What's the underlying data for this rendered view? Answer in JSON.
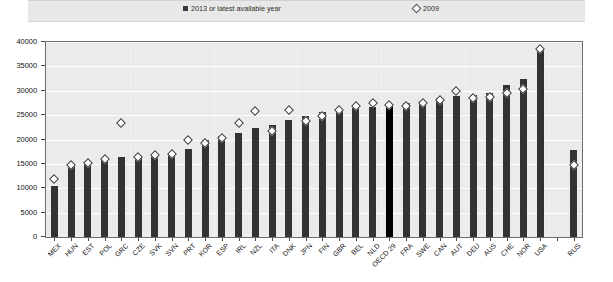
{
  "legend": {
    "items": [
      {
        "label": "2013 or latest available year",
        "marker": "filled-square-icon",
        "color": "#3a3a3a"
      },
      {
        "label": "2009",
        "marker": "open-diamond-icon",
        "color": "#ffffff"
      }
    ]
  },
  "axis": {
    "y_ticks": [
      "0",
      "5000",
      "10000",
      "15000",
      "20000",
      "25000",
      "30000",
      "35000",
      "40000"
    ]
  },
  "colors": {
    "bar": "#333333",
    "bar_highlight": "#000000",
    "marker_fill": "#ffffff",
    "marker_edge": "#3d3d3d",
    "plot_background": "#ebebeb",
    "legend_background": "#e8e8e8",
    "gridline": "#ffffff"
  },
  "chart_data": {
    "type": "bar",
    "title": "",
    "xlabel": "",
    "ylabel": "",
    "ylim": [
      0,
      40000
    ],
    "ytick_step": 5000,
    "grid": true,
    "legend_position": "top",
    "highlight_category": "OECD 29",
    "categories": [
      "MEX",
      "HUN",
      "EST",
      "POL",
      "GRC",
      "CZE",
      "SVK",
      "SVN",
      "PRT",
      "KOR",
      "ESP",
      "IRL",
      "NZL",
      "ITA",
      "DNK",
      "JPN",
      "FIN",
      "GBR",
      "BEL",
      "NLD",
      "OECD 29",
      "FRA",
      "SWE",
      "CAN",
      "AUT",
      "DEU",
      "AUS",
      "CHE",
      "NOR",
      "USA",
      "",
      "RUS"
    ],
    "series": [
      {
        "name": "2013 or latest available year",
        "type": "bar",
        "values": [
          10400,
          14600,
          15500,
          16200,
          16400,
          16600,
          16900,
          17200,
          18100,
          19900,
          20700,
          21400,
          22400,
          22900,
          24000,
          24800,
          25600,
          26100,
          26400,
          26700,
          26900,
          27500,
          28000,
          28600,
          29000,
          29100,
          29500,
          31100,
          32400,
          38700,
          null,
          17800
        ]
      },
      {
        "name": "2009",
        "type": "scatter",
        "marker": "open-diamond",
        "values": [
          12000,
          14800,
          15200,
          15900,
          23400,
          16400,
          16800,
          17100,
          19900,
          19200,
          20400,
          23300,
          25800,
          21800,
          26100,
          23800,
          24900,
          26000,
          26900,
          27400,
          27100,
          26800,
          27500,
          28200,
          29900,
          28600,
          28800,
          29600,
          30400,
          38600,
          null,
          14700
        ]
      }
    ]
  }
}
